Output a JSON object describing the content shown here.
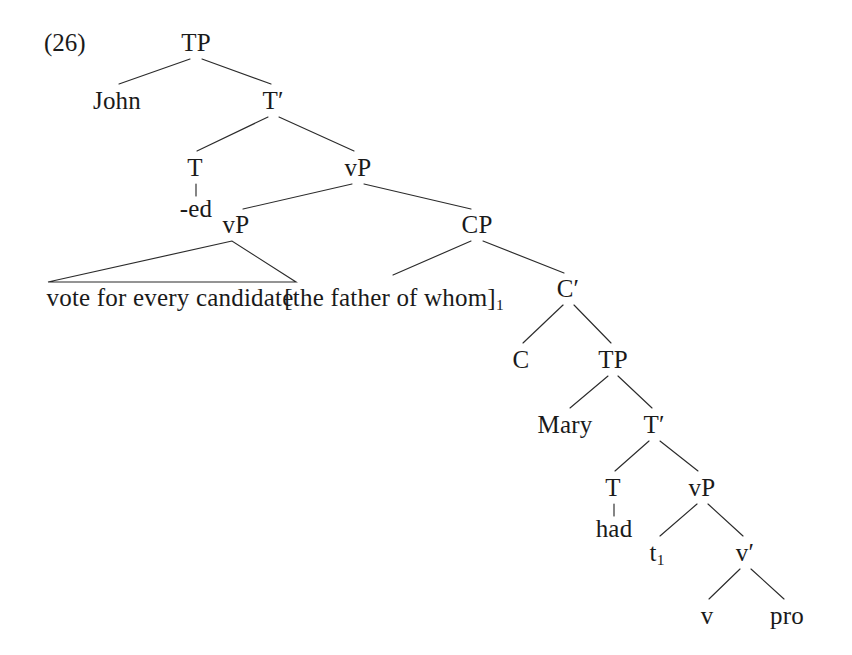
{
  "figure": {
    "example_number": "(26)",
    "example_number_x": 44,
    "example_number_y": 30,
    "width": 852,
    "height": 655,
    "background_color": "#ffffff",
    "ink_color": "#1a1a1a",
    "edge_color": "#2b2b2b",
    "caption_note": "Syntax tree for: John -ed vote for every candidate [the father of whom]1 C Mary had t1 v pro"
  },
  "nodes": [
    {
      "id": "tp-root",
      "label": "TP",
      "x": 196,
      "y": 30,
      "interactable": false
    },
    {
      "id": "john",
      "label": "John",
      "x": 117,
      "y": 88,
      "interactable": false
    },
    {
      "id": "t-bar-1",
      "label": "T′",
      "x": 273,
      "y": 88,
      "interactable": false
    },
    {
      "id": "t-1",
      "label": "T",
      "x": 195,
      "y": 155,
      "interactable": false
    },
    {
      "id": "ed",
      "label": "-ed",
      "x": 196,
      "y": 196,
      "interactable": false
    },
    {
      "id": "vp-outer",
      "label": "vP",
      "x": 358,
      "y": 155,
      "interactable": false
    },
    {
      "id": "vp-inner",
      "label": "vP",
      "x": 236,
      "y": 212,
      "interactable": false
    },
    {
      "id": "vote-phrase",
      "label": "vote for every candidate",
      "x": 170,
      "y": 285,
      "interactable": false
    },
    {
      "id": "cp",
      "label": "CP",
      "x": 477,
      "y": 212,
      "interactable": false
    },
    {
      "id": "father-of-whom",
      "label": "[the father of whom]",
      "sub": "1",
      "x": 394,
      "y": 285,
      "interactable": false
    },
    {
      "id": "c-bar",
      "label": "C′",
      "x": 568,
      "y": 276,
      "interactable": false
    },
    {
      "id": "c",
      "label": "C",
      "x": 521,
      "y": 347,
      "interactable": false
    },
    {
      "id": "tp-inner",
      "label": "TP",
      "x": 613,
      "y": 347,
      "interactable": false
    },
    {
      "id": "mary",
      "label": "Mary",
      "x": 565,
      "y": 412,
      "interactable": false
    },
    {
      "id": "t-bar-2",
      "label": "T′",
      "x": 654,
      "y": 412,
      "interactable": false
    },
    {
      "id": "t-2",
      "label": "T",
      "x": 613,
      "y": 475,
      "interactable": false
    },
    {
      "id": "had",
      "label": "had",
      "x": 614,
      "y": 516,
      "interactable": false
    },
    {
      "id": "vp-embedded",
      "label": "vP",
      "x": 702,
      "y": 475,
      "interactable": false
    },
    {
      "id": "trace-1",
      "label": "t",
      "sub": "1",
      "x": 657,
      "y": 540,
      "interactable": false
    },
    {
      "id": "v-bar",
      "label": "v′",
      "x": 745,
      "y": 540,
      "interactable": false
    },
    {
      "id": "little-v",
      "label": "v",
      "x": 707,
      "y": 603,
      "interactable": false
    },
    {
      "id": "pro",
      "label": "pro",
      "x": 787,
      "y": 603,
      "interactable": false
    }
  ],
  "edges": [
    {
      "id": "tp-to-john",
      "from": "tp-root",
      "to": "john",
      "x1": 190,
      "y1": 59,
      "x2": 119,
      "y2": 84
    },
    {
      "id": "tp-to-tbar1",
      "from": "tp-root",
      "to": "t-bar-1",
      "x1": 202,
      "y1": 59,
      "x2": 271,
      "y2": 84
    },
    {
      "id": "tbar1-to-t1",
      "from": "t-bar-1",
      "to": "t-1",
      "x1": 268,
      "y1": 117,
      "x2": 197,
      "y2": 151
    },
    {
      "id": "tbar1-to-vp-outer",
      "from": "t-bar-1",
      "to": "vp-outer",
      "x1": 279,
      "y1": 117,
      "x2": 354,
      "y2": 151
    },
    {
      "id": "t1-to-ed",
      "from": "t-1",
      "to": "ed",
      "x1": 196,
      "y1": 184,
      "x2": 196,
      "y2": 196
    },
    {
      "id": "vp-outer-to-vp-inner",
      "from": "vp-outer",
      "to": "vp-inner",
      "x1": 352,
      "y1": 184,
      "x2": 243,
      "y2": 209
    },
    {
      "id": "vp-outer-to-cp",
      "from": "vp-outer",
      "to": "cp",
      "x1": 364,
      "y1": 184,
      "x2": 471,
      "y2": 209
    },
    {
      "id": "cp-to-father",
      "from": "cp",
      "to": "father-of-whom",
      "x1": 471,
      "y1": 241,
      "x2": 393,
      "y2": 275
    },
    {
      "id": "cp-to-cbar",
      "from": "cp",
      "to": "c-bar",
      "x1": 483,
      "y1": 241,
      "x2": 564,
      "y2": 273
    },
    {
      "id": "cbar-to-c",
      "from": "c-bar",
      "to": "c",
      "x1": 563,
      "y1": 305,
      "x2": 523,
      "y2": 343
    },
    {
      "id": "cbar-to-tp-inner",
      "from": "c-bar",
      "to": "tp-inner",
      "x1": 574,
      "y1": 305,
      "x2": 611,
      "y2": 343
    },
    {
      "id": "tp-inner-to-mary",
      "from": "tp-inner",
      "to": "mary",
      "x1": 608,
      "y1": 376,
      "x2": 570,
      "y2": 408
    },
    {
      "id": "tp-inner-to-tbar2",
      "from": "tp-inner",
      "to": "t-bar-2",
      "x1": 618,
      "y1": 376,
      "x2": 652,
      "y2": 408
    },
    {
      "id": "tbar2-to-t2",
      "from": "t-bar-2",
      "to": "t-2",
      "x1": 649,
      "y1": 441,
      "x2": 615,
      "y2": 471
    },
    {
      "id": "tbar2-to-vp-emb",
      "from": "t-bar-2",
      "to": "vp-embedded",
      "x1": 660,
      "y1": 441,
      "x2": 698,
      "y2": 471
    },
    {
      "id": "t2-to-had",
      "from": "t-2",
      "to": "had",
      "x1": 614,
      "y1": 504,
      "x2": 614,
      "y2": 516
    },
    {
      "id": "vp-emb-to-trace",
      "from": "vp-embedded",
      "to": "trace-1",
      "x1": 697,
      "y1": 504,
      "x2": 660,
      "y2": 536
    },
    {
      "id": "vp-emb-to-vbar",
      "from": "vp-embedded",
      "to": "v-bar",
      "x1": 708,
      "y1": 504,
      "x2": 743,
      "y2": 536
    },
    {
      "id": "vbar-to-little-v",
      "from": "v-bar",
      "to": "little-v",
      "x1": 740,
      "y1": 569,
      "x2": 709,
      "y2": 599
    },
    {
      "id": "vbar-to-pro",
      "from": "v-bar",
      "to": "pro",
      "x1": 751,
      "y1": 569,
      "x2": 784,
      "y2": 599
    }
  ],
  "triangles": [
    {
      "id": "vote-triangle",
      "dominates": "vote for every candidate",
      "apex_x": 232,
      "apex_y": 241,
      "left_x": 48,
      "right_x": 296,
      "base_y": 282
    }
  ]
}
